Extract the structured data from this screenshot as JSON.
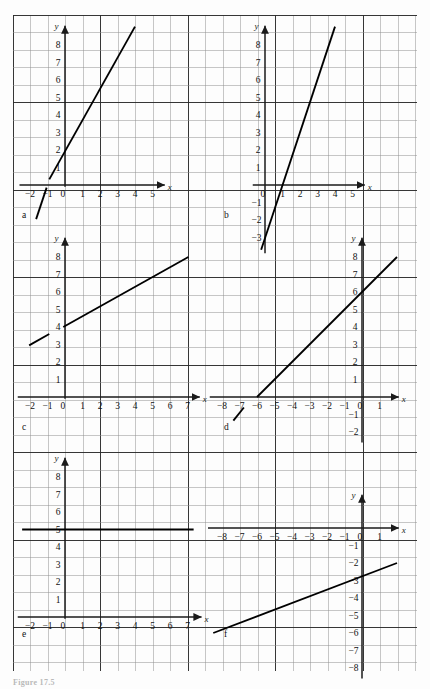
{
  "figure": {
    "caption": "Figure 17.5",
    "grid": {
      "left": 13,
      "top": 15,
      "right": 417,
      "bottom": 671,
      "cell": 17.5,
      "minor_color": "#8f8f8f",
      "major_color": "#2b2b2b",
      "background": "#fdfdfd"
    },
    "axis_color": "#1a1a1a",
    "line_color": "#000000"
  },
  "panels": [
    {
      "id": "a",
      "label": "a",
      "label_pos": {
        "x": 22,
        "y": 218
      },
      "origin": {
        "x": 65,
        "y": 185
      },
      "unit": 17.5,
      "x_axis_label": "x",
      "y_axis_label": "y",
      "x_ticks": [
        {
          "value": -2,
          "label": "−2"
        },
        {
          "value": -1,
          "label": "−1"
        },
        {
          "value": 0,
          "label": "0"
        },
        {
          "value": 1,
          "label": "1"
        },
        {
          "value": 2,
          "label": "2"
        },
        {
          "value": 3,
          "label": "3"
        },
        {
          "value": 4,
          "label": "4"
        },
        {
          "value": 5,
          "label": "5"
        }
      ],
      "y_ticks": [
        {
          "value": 1,
          "label": "1"
        },
        {
          "value": 2,
          "label": "2"
        },
        {
          "value": 3,
          "label": "3"
        },
        {
          "value": 4,
          "label": "4"
        },
        {
          "value": 5,
          "label": "5"
        },
        {
          "value": 6,
          "label": "6"
        },
        {
          "value": 7,
          "label": "7"
        },
        {
          "value": 8,
          "label": "8"
        }
      ],
      "x_axis_from": -2.6,
      "x_axis_to": 5.7,
      "y_axis_from": -0.1,
      "y_axis_to": 9.1,
      "segments": [
        {
          "x1": -1.65,
          "y1": -1.95,
          "x2": -1.05,
          "y2": -0.15
        },
        {
          "x1": -0.9,
          "y1": 0.32,
          "x2": 4.0,
          "y2": 9.05
        }
      ],
      "equation_note": "slope 3, y-intercept 3"
    },
    {
      "id": "b",
      "label": "b",
      "label_pos": {
        "x": 224,
        "y": 218
      },
      "origin": {
        "x": 265,
        "y": 185
      },
      "unit": 17.5,
      "x_axis_label": "x",
      "y_axis_label": "y",
      "x_ticks": [
        {
          "value": 0,
          "label": "0"
        },
        {
          "value": 1,
          "label": "1"
        },
        {
          "value": 2,
          "label": "2"
        },
        {
          "value": 3,
          "label": "3"
        },
        {
          "value": 4,
          "label": "4"
        },
        {
          "value": 5,
          "label": "5"
        }
      ],
      "y_ticks": [
        {
          "value": 1,
          "label": "1"
        },
        {
          "value": 2,
          "label": "2"
        },
        {
          "value": 3,
          "label": "3"
        },
        {
          "value": 4,
          "label": "4"
        },
        {
          "value": 5,
          "label": "5"
        },
        {
          "value": 6,
          "label": "6"
        },
        {
          "value": 7,
          "label": "7"
        },
        {
          "value": 8,
          "label": "8"
        }
      ],
      "y_neg_ticks": [
        {
          "value": -1,
          "label": "−1"
        },
        {
          "value": -2,
          "label": "−2"
        },
        {
          "value": -3,
          "label": "−3"
        }
      ],
      "x_axis_from": -0.7,
      "x_axis_to": 5.7,
      "y_axis_from": -3.9,
      "y_axis_to": 9.1,
      "segments": [
        {
          "x1": -0.22,
          "y1": -3.7,
          "x2": 4.0,
          "y2": 9.05
        }
      ],
      "equation_note": "slope 3, y-intercept -3"
    },
    {
      "id": "c",
      "label": "c",
      "label_pos": {
        "x": 22,
        "y": 430
      },
      "origin": {
        "x": 65,
        "y": 397
      },
      "unit": 17.5,
      "x_axis_label": "x",
      "y_axis_label": "y",
      "x_ticks": [
        {
          "value": -2,
          "label": "−2"
        },
        {
          "value": -1,
          "label": "−1"
        },
        {
          "value": 0,
          "label": "0"
        },
        {
          "value": 1,
          "label": "1"
        },
        {
          "value": 2,
          "label": "2"
        },
        {
          "value": 3,
          "label": "3"
        },
        {
          "value": 4,
          "label": "4"
        },
        {
          "value": 5,
          "label": "5"
        },
        {
          "value": 6,
          "label": "6"
        },
        {
          "value": 7,
          "label": "7"
        }
      ],
      "y_ticks": [
        {
          "value": 1,
          "label": "1"
        },
        {
          "value": 2,
          "label": "2"
        },
        {
          "value": 3,
          "label": "3"
        },
        {
          "value": 4,
          "label": "4"
        },
        {
          "value": 5,
          "label": "5"
        },
        {
          "value": 6,
          "label": "6"
        },
        {
          "value": 7,
          "label": "7"
        },
        {
          "value": 8,
          "label": "8"
        }
      ],
      "x_axis_from": -2.7,
      "x_axis_to": 7.7,
      "y_axis_from": -0.1,
      "y_axis_to": 9.1,
      "segments": [
        {
          "x1": -2.05,
          "y1": 2.95,
          "x2": -0.9,
          "y2": 3.6
        },
        {
          "x1": -0.1,
          "y1": 4.0,
          "x2": 7.05,
          "y2": 8.0
        }
      ],
      "equation_note": "slope 0.56, y-intercept 4"
    },
    {
      "id": "d",
      "label": "d",
      "label_pos": {
        "x": 224,
        "y": 430
      },
      "origin": {
        "x": 362,
        "y": 397
      },
      "unit": 17.5,
      "x_axis_label": "x",
      "y_axis_label": "y",
      "x_ticks": [
        {
          "value": -8,
          "label": "−8"
        },
        {
          "value": -7,
          "label": "−7"
        },
        {
          "value": -6,
          "label": "−6"
        },
        {
          "value": -5,
          "label": "−5"
        },
        {
          "value": -4,
          "label": "−4"
        },
        {
          "value": -3,
          "label": "−3"
        },
        {
          "value": -2,
          "label": "−2"
        },
        {
          "value": -1,
          "label": "−1"
        },
        {
          "value": 0,
          "label": "0"
        },
        {
          "value": 1,
          "label": "1"
        }
      ],
      "y_ticks": [
        {
          "value": 1,
          "label": "1"
        },
        {
          "value": 2,
          "label": "2"
        },
        {
          "value": 3,
          "label": "3"
        },
        {
          "value": 4,
          "label": "4"
        },
        {
          "value": 5,
          "label": "5"
        },
        {
          "value": 6,
          "label": "6"
        },
        {
          "value": 7,
          "label": "7"
        },
        {
          "value": 8,
          "label": "8"
        }
      ],
      "y_neg_ticks": [
        {
          "value": -1,
          "label": "−1"
        },
        {
          "value": -2,
          "label": "−2"
        }
      ],
      "x_axis_from": -8.7,
      "x_axis_to": 2.1,
      "y_axis_from": -2.6,
      "y_axis_to": 9.1,
      "segments": [
        {
          "x1": -7.35,
          "y1": -1.35,
          "x2": -6.75,
          "y2": -0.6
        },
        {
          "x1": -6.0,
          "y1": 0.0,
          "x2": 2.0,
          "y2": 8.0
        }
      ],
      "equation_note": "slope 1, y-intercept 6"
    },
    {
      "id": "e",
      "label": "e",
      "label_pos": {
        "x": 22,
        "y": 637
      },
      "origin": {
        "x": 65,
        "y": 617
      },
      "unit": 17.5,
      "x_axis_label": "x",
      "y_axis_label": "y",
      "x_ticks": [
        {
          "value": -2,
          "label": "−2"
        },
        {
          "value": -1,
          "label": "−1"
        },
        {
          "value": 0,
          "label": "0"
        },
        {
          "value": 1,
          "label": "1"
        },
        {
          "value": 2,
          "label": "2"
        },
        {
          "value": 3,
          "label": "3"
        },
        {
          "value": 4,
          "label": "4"
        },
        {
          "value": 5,
          "label": "5"
        },
        {
          "value": 6,
          "label": "6"
        },
        {
          "value": 7,
          "label": "7"
        }
      ],
      "y_ticks": [
        {
          "value": 1,
          "label": "1"
        },
        {
          "value": 2,
          "label": "2"
        },
        {
          "value": 3,
          "label": "3"
        },
        {
          "value": 4,
          "label": "4"
        },
        {
          "value": 5,
          "label": "5"
        },
        {
          "value": 6,
          "label": "6"
        },
        {
          "value": 7,
          "label": "7"
        },
        {
          "value": 8,
          "label": "8"
        }
      ],
      "x_axis_from": -2.7,
      "x_axis_to": 7.8,
      "y_axis_from": -0.1,
      "y_axis_to": 9.1,
      "segments": [
        {
          "x1": -2.45,
          "y1": 5.0,
          "x2": 7.35,
          "y2": 5.0
        }
      ],
      "equation_note": "horizontal line y = 5"
    },
    {
      "id": "f",
      "label": "f",
      "label_pos": {
        "x": 224,
        "y": 637
      },
      "origin": {
        "x": 362,
        "y": 528
      },
      "unit": 17.5,
      "x_axis_label": "x",
      "y_axis_label": "y",
      "x_ticks": [
        {
          "value": -8,
          "label": "−8"
        },
        {
          "value": -7,
          "label": "−7"
        },
        {
          "value": -6,
          "label": "−6"
        },
        {
          "value": -5,
          "label": "−5"
        },
        {
          "value": -4,
          "label": "−4"
        },
        {
          "value": -3,
          "label": "−3"
        },
        {
          "value": -2,
          "label": "−2"
        },
        {
          "value": -1,
          "label": "−1"
        },
        {
          "value": 0,
          "label": "0"
        },
        {
          "value": 1,
          "label": "1"
        }
      ],
      "y_ticks": [],
      "y_neg_ticks": [
        {
          "value": -1,
          "label": "−1"
        },
        {
          "value": -2,
          "label": "−2"
        },
        {
          "value": -3,
          "label": "−3"
        },
        {
          "value": -4,
          "label": "−4"
        },
        {
          "value": -5,
          "label": "−5"
        },
        {
          "value": -6,
          "label": "−6"
        },
        {
          "value": -7,
          "label": "−7"
        },
        {
          "value": -8,
          "label": "−8"
        }
      ],
      "x_axis_from": -8.8,
      "x_axis_to": 2.1,
      "y_axis_from": -8.6,
      "y_axis_to": 1.9,
      "segments": [
        {
          "x1": -8.5,
          "y1": -6.0,
          "x2": 2.0,
          "y2": -2.0
        }
      ],
      "equation_note": "slope 0.38, y-intercept -3"
    }
  ],
  "chart_data": {
    "type": "line",
    "title": "Figure 17.5",
    "xlabel": "x",
    "ylabel": "y",
    "grid": true,
    "legend": "none",
    "panels": [
      {
        "id": "a",
        "xlim": [
          -2.6,
          5.7
        ],
        "ylim": [
          -2.1,
          9.1
        ],
        "xticks": [
          -2,
          -1,
          0,
          1,
          2,
          3,
          4,
          5
        ],
        "yticks": [
          1,
          2,
          3,
          4,
          5,
          6,
          7,
          8
        ],
        "slope": 3,
        "intercept": 3,
        "points": [
          [
            -1.65,
            -1.95
          ],
          [
            -1,
            0
          ],
          [
            0,
            3
          ],
          [
            4,
            9
          ]
        ]
      },
      {
        "id": "b",
        "xlim": [
          -0.7,
          5.7
        ],
        "ylim": [
          -3.9,
          9.1
        ],
        "xticks": [
          0,
          1,
          2,
          3,
          4,
          5
        ],
        "yticks": [
          -3,
          -2,
          -1,
          1,
          2,
          3,
          4,
          5,
          6,
          7,
          8
        ],
        "slope": 3,
        "intercept": -3,
        "points": [
          [
            -0.22,
            -3.7
          ],
          [
            0,
            -3
          ],
          [
            1,
            0
          ],
          [
            4,
            9
          ]
        ]
      },
      {
        "id": "c",
        "xlim": [
          -2.7,
          7.7
        ],
        "ylim": [
          -0.1,
          9.1
        ],
        "xticks": [
          -2,
          -1,
          0,
          1,
          2,
          3,
          4,
          5,
          6,
          7
        ],
        "yticks": [
          1,
          2,
          3,
          4,
          5,
          6,
          7,
          8
        ],
        "slope": 0.5555,
        "intercept": 4,
        "points": [
          [
            -2,
            3
          ],
          [
            0,
            4
          ],
          [
            7,
            8
          ]
        ]
      },
      {
        "id": "d",
        "xlim": [
          -8.7,
          2.1
        ],
        "ylim": [
          -2.6,
          9.1
        ],
        "xticks": [
          -8,
          -7,
          -6,
          -5,
          -4,
          -3,
          -2,
          -1,
          0,
          1
        ],
        "yticks": [
          -2,
          -1,
          1,
          2,
          3,
          4,
          5,
          6,
          7,
          8
        ],
        "slope": 1,
        "intercept": 6,
        "points": [
          [
            -7.35,
            -1.35
          ],
          [
            -6,
            0
          ],
          [
            0,
            6
          ],
          [
            2,
            8
          ]
        ]
      },
      {
        "id": "e",
        "xlim": [
          -2.7,
          7.8
        ],
        "ylim": [
          -0.1,
          9.1
        ],
        "xticks": [
          -2,
          -1,
          0,
          1,
          2,
          3,
          4,
          5,
          6,
          7
        ],
        "yticks": [
          1,
          2,
          3,
          4,
          5,
          6,
          7,
          8
        ],
        "slope": 0,
        "intercept": 5,
        "points": [
          [
            -2.45,
            5
          ],
          [
            0,
            5
          ],
          [
            7.35,
            5
          ]
        ]
      },
      {
        "id": "f",
        "xlim": [
          -8.8,
          2.1
        ],
        "ylim": [
          -8.6,
          1.9
        ],
        "xticks": [
          -8,
          -7,
          -6,
          -5,
          -4,
          -3,
          -2,
          -1,
          0,
          1
        ],
        "yticks": [
          -8,
          -7,
          -6,
          -5,
          -4,
          -3,
          -2,
          -1
        ],
        "slope": 0.381,
        "intercept": -3,
        "points": [
          [
            -8.5,
            -6
          ],
          [
            0,
            -3
          ],
          [
            2,
            -2
          ]
        ]
      }
    ]
  }
}
